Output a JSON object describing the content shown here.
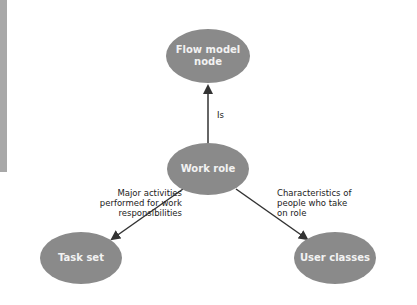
{
  "colors": {
    "node_fill": "#8a8a8a",
    "edge": "#333333",
    "side_bar": "#a8a8a8"
  },
  "nodes": {
    "flow_model_node": {
      "label": "Flow model\nnode"
    },
    "work_role": {
      "label": "Work role"
    },
    "task_set": {
      "label": "Task set"
    },
    "user_classes": {
      "label": "User classes"
    }
  },
  "edges": {
    "is": {
      "label": "Is"
    },
    "major_activities": {
      "label": "Major activities\nperformed for work\nresponsibilities"
    },
    "characteristics": {
      "label": "Characteristics of\npeople who take\non role"
    }
  }
}
